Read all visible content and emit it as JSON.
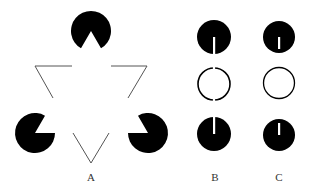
{
  "figure": {
    "panels": [
      {
        "id": "A",
        "label": "A",
        "content": "Kanizsa triangle: three black pac-man inducers plus line-outline triangle corners"
      },
      {
        "id": "B",
        "label": "B",
        "content": "Column of two slit black discs and a gapped ring"
      },
      {
        "id": "C",
        "label": "C",
        "content": "Column of two slit black discs (slits not reaching edge) and a complete ring"
      }
    ]
  },
  "colors": {
    "fill": "#000000",
    "line": "#555555",
    "background": "#ffffff"
  }
}
